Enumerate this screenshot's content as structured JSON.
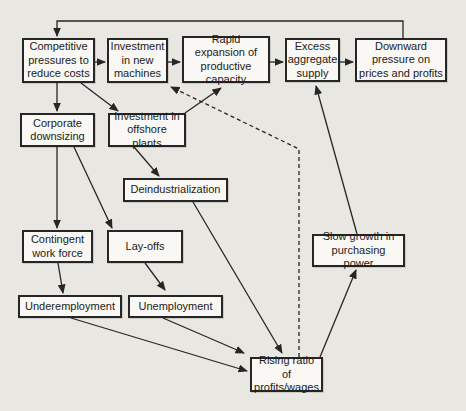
{
  "diagram": {
    "colors": {
      "background": "#e8e7e2",
      "box_fill": "#f9f8f4",
      "box_border": "#262626",
      "text": "#1b1b1b",
      "arrow": "#262626"
    },
    "nodes": [
      {
        "id": "competitive-pressures",
        "label": "Competitive pressures to reduce costs",
        "x": 22,
        "y": 38,
        "w": 73,
        "h": 45
      },
      {
        "id": "new-machines",
        "label": "Investment in new machines",
        "x": 107,
        "y": 38,
        "w": 61,
        "h": 45
      },
      {
        "id": "rapid-expansion",
        "label": "Rapid expansion of productive capacity",
        "x": 182,
        "y": 36,
        "w": 88,
        "h": 47
      },
      {
        "id": "excess-supply",
        "label": "Excess aggregate supply",
        "x": 285,
        "y": 38,
        "w": 55,
        "h": 44
      },
      {
        "id": "downward-pressure",
        "label": "Downward pressure on prices and profits",
        "x": 355,
        "y": 38,
        "w": 92,
        "h": 44
      },
      {
        "id": "corporate-downsizing",
        "label": "Corporate downsizing",
        "x": 20,
        "y": 113,
        "w": 75,
        "h": 34
      },
      {
        "id": "offshore-plants",
        "label": "Investment in offshore plants",
        "x": 108,
        "y": 113,
        "w": 78,
        "h": 34
      },
      {
        "id": "deindustrialization",
        "label": "Deindustrialization",
        "x": 123,
        "y": 178,
        "w": 105,
        "h": 24
      },
      {
        "id": "contingent-workforce",
        "label": "Contingent work force",
        "x": 22,
        "y": 230,
        "w": 71,
        "h": 33
      },
      {
        "id": "layoffs",
        "label": "Lay-offs",
        "x": 107,
        "y": 230,
        "w": 76,
        "h": 33
      },
      {
        "id": "underemployment",
        "label": "Underemployment",
        "x": 18,
        "y": 295,
        "w": 104,
        "h": 23
      },
      {
        "id": "unemployment",
        "label": "Unemployment",
        "x": 128,
        "y": 295,
        "w": 95,
        "h": 23
      },
      {
        "id": "slow-growth",
        "label": "Slow growth in purchasing power",
        "x": 312,
        "y": 234,
        "w": 93,
        "h": 33
      },
      {
        "id": "rising-ratio",
        "label": "Rising ratio of profits/wages",
        "x": 250,
        "y": 357,
        "w": 73,
        "h": 35
      }
    ],
    "edges": [
      {
        "from": "competitive-pressures",
        "to": "new-machines",
        "style": "solid",
        "points": [
          [
            95,
            62
          ],
          [
            105,
            62
          ]
        ]
      },
      {
        "from": "new-machines",
        "to": "rapid-expansion",
        "style": "solid",
        "points": [
          [
            168,
            62
          ],
          [
            180,
            62
          ]
        ]
      },
      {
        "from": "rapid-expansion",
        "to": "excess-supply",
        "style": "solid",
        "points": [
          [
            270,
            62
          ],
          [
            283,
            62
          ]
        ]
      },
      {
        "from": "excess-supply",
        "to": "downward-pressure",
        "style": "solid",
        "points": [
          [
            340,
            62
          ],
          [
            353,
            62
          ]
        ]
      },
      {
        "from": "downward-pressure",
        "to": "competitive-pressures",
        "style": "solid",
        "points": [
          [
            403,
            38
          ],
          [
            403,
            21
          ],
          [
            57,
            21
          ],
          [
            57,
            36
          ]
        ]
      },
      {
        "from": "competitive-pressures",
        "to": "corporate-downsizing",
        "style": "solid",
        "points": [
          [
            57,
            83
          ],
          [
            57,
            111
          ]
        ]
      },
      {
        "from": "competitive-pressures",
        "to": "offshore-plants",
        "style": "solid",
        "points": [
          [
            81,
            83
          ],
          [
            118,
            111
          ]
        ]
      },
      {
        "from": "corporate-downsizing",
        "to": "contingent-workforce",
        "style": "solid",
        "points": [
          [
            57,
            147
          ],
          [
            57,
            228
          ]
        ]
      },
      {
        "from": "corporate-downsizing",
        "to": "layoffs",
        "style": "solid",
        "points": [
          [
            74,
            147
          ],
          [
            112,
            228
          ]
        ]
      },
      {
        "from": "offshore-plants",
        "to": "deindustrialization",
        "style": "solid",
        "points": [
          [
            134,
            147
          ],
          [
            159,
            176
          ]
        ]
      },
      {
        "from": "offshore-plants",
        "to": "rapid-expansion",
        "style": "solid",
        "points": [
          [
            185,
            113
          ],
          [
            221,
            88
          ]
        ]
      },
      {
        "from": "contingent-workforce",
        "to": "underemployment",
        "style": "solid",
        "points": [
          [
            58,
            263
          ],
          [
            63,
            293
          ]
        ]
      },
      {
        "from": "layoffs",
        "to": "unemployment",
        "style": "solid",
        "points": [
          [
            145,
            263
          ],
          [
            165,
            290
          ]
        ]
      },
      {
        "from": "underemployment",
        "to": "rising-ratio",
        "style": "solid",
        "points": [
          [
            71,
            318
          ],
          [
            247,
            371
          ]
        ]
      },
      {
        "from": "unemployment",
        "to": "rising-ratio",
        "style": "solid",
        "points": [
          [
            163,
            318
          ],
          [
            244,
            353
          ]
        ]
      },
      {
        "from": "deindustrialization",
        "to": "rising-ratio",
        "style": "solid",
        "points": [
          [
            193,
            202
          ],
          [
            282,
            353
          ]
        ]
      },
      {
        "from": "rising-ratio",
        "to": "slow-growth",
        "style": "solid",
        "points": [
          [
            320,
            357
          ],
          [
            356,
            270
          ]
        ]
      },
      {
        "from": "slow-growth",
        "to": "excess-supply",
        "style": "solid",
        "points": [
          [
            357,
            234
          ],
          [
            316,
            86
          ]
        ]
      },
      {
        "from": "rising-ratio",
        "to": "new-machines",
        "style": "dashed",
        "points": [
          [
            299,
            357
          ],
          [
            299,
            149
          ],
          [
            171,
            87
          ]
        ]
      }
    ]
  }
}
